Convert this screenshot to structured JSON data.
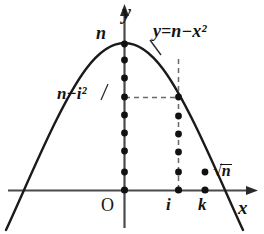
{
  "figure": {
    "background_color": "#ffffff",
    "ink_color": "#141414",
    "axes": {
      "y_axis_label": "y",
      "x_axis_label": "x",
      "origin_label": "O"
    },
    "labels": {
      "vertex_value": "n",
      "curve_equation": "y=n−x²",
      "height_at_i": "n−i²",
      "x_tick_i": "i",
      "x_tick_k": "k",
      "root_label": "√n",
      "root_radicand": "n"
    },
    "curve": {
      "type": "parabola",
      "equation": "y = n - x^2",
      "vertex": {
        "x": 0,
        "y": "n"
      },
      "roots": [
        "-√n",
        "√n"
      ],
      "opens": "down"
    },
    "dot_columns": [
      {
        "name": "column-at-0",
        "x_label": "0",
        "count": 10
      },
      {
        "name": "column-at-i",
        "x_label": "i",
        "count": 7
      },
      {
        "name": "column-at-k",
        "x_label": "k",
        "count": 2
      }
    ],
    "guides": [
      {
        "name": "horizontal-dashed-to-curve",
        "from": "y-axis at n−i²",
        "to": "curve point at x=i",
        "style": "dashed"
      },
      {
        "name": "vertical-dashed-at-i",
        "from": "x-axis at i",
        "to": "curve point at x=i",
        "style": "dashed"
      }
    ]
  }
}
